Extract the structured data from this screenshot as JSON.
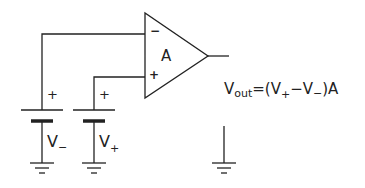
{
  "diagram": {
    "amplifier": {
      "label": "A",
      "inverting_sign": "−",
      "noninverting_sign": "+"
    },
    "battery_minus": {
      "plus_sign": "+",
      "label_main": "V",
      "label_sub": "−"
    },
    "battery_plus": {
      "plus_sign": "+",
      "label_main": "V",
      "label_sub": "+"
    },
    "equation": {
      "lhs_main": "V",
      "lhs_sub": "out",
      "eq": "=(V",
      "sub1": "+",
      "minus": "−V",
      "sub2": "−",
      "tail": ")A"
    },
    "stroke_color": "#222222"
  }
}
